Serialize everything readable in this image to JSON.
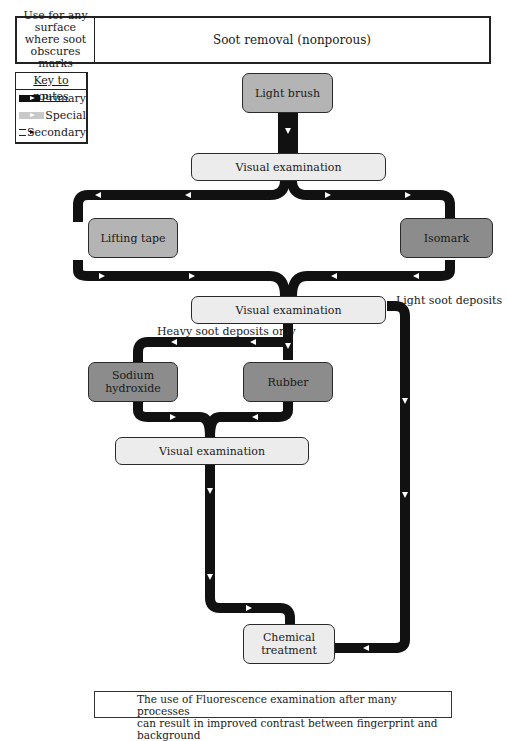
{
  "header": {
    "applicability": "Use for any surface where soot obscures marks",
    "title": "Soot removal (nonporous)"
  },
  "key": {
    "title": "Key to routes",
    "routes": [
      {
        "label": "Primary",
        "style": "primary",
        "color": "#111111"
      },
      {
        "label": "Special",
        "style": "special",
        "color": "#c8c8c8"
      },
      {
        "label": "Secondary",
        "style": "secondary",
        "color": "#111111"
      }
    ]
  },
  "nodes": {
    "light_brush": "Light brush",
    "visual_exam_1": "Visual examination",
    "lifting_tape": "Lifting tape",
    "isomark": "Isomark",
    "visual_exam_2": "Visual examination",
    "sodium_hydroxide": "Sodium hydroxide",
    "rubber": "Rubber",
    "visual_exam_3": "Visual examination",
    "chemical_treatment": "Chemical treatment"
  },
  "annotations": {
    "light_soot": "Light soot deposits",
    "heavy_soot": "Heavy soot deposits only"
  },
  "footer": {
    "line1": "The use of Fluorescence examination after many processes",
    "line2": "can result in improved contrast between fingerprint and background"
  },
  "colors": {
    "route_primary": "#111111",
    "node_light": "#ececec",
    "node_mid": "#b4b4b4",
    "node_dark": "#8c8c8c"
  }
}
